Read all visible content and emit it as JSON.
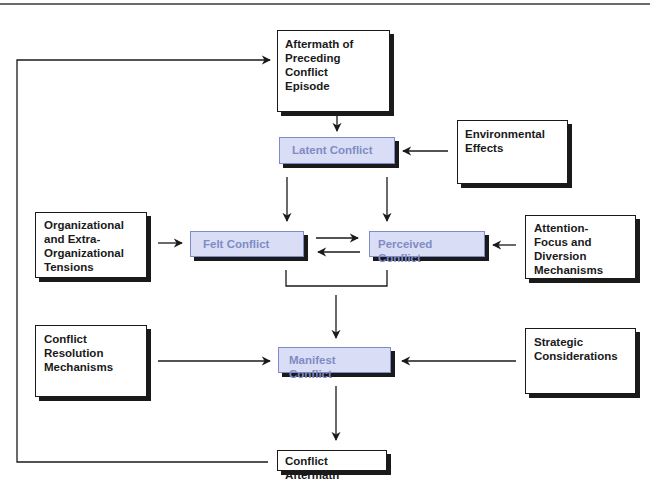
{
  "diagram": {
    "title": "",
    "nodes": {
      "aftermath_preceding": {
        "label": "Aftermath of\nPreceding Conflict\nEpisode",
        "style": "outcome"
      },
      "latent": {
        "label": "Latent Conflict",
        "style": "stage"
      },
      "environmental": {
        "label": "Environmental\nEffects",
        "style": "influence"
      },
      "org_tensions": {
        "label": "Organizational\nand Extra-\nOrganizational\nTensions",
        "style": "influence"
      },
      "felt": {
        "label": "Felt Conflict",
        "style": "stage"
      },
      "perceived": {
        "label": "Perceived Conflict",
        "style": "stage"
      },
      "attention": {
        "label": "Attention-\nFocus and\nDiversion\nMechanisms",
        "style": "influence"
      },
      "resolution": {
        "label": "Conflict\nResolution\nMechanisms",
        "style": "influence"
      },
      "manifest": {
        "label": "Manifest Conflict",
        "style": "stage"
      },
      "strategic": {
        "label": "Strategic\nConsiderations",
        "style": "influence"
      },
      "aftermath": {
        "label": "Conflict Aftermath",
        "style": "outcome"
      }
    },
    "edges": [
      {
        "from": "aftermath_preceding",
        "to": "latent"
      },
      {
        "from": "environmental",
        "to": "latent"
      },
      {
        "from": "latent",
        "to": "felt"
      },
      {
        "from": "latent",
        "to": "perceived"
      },
      {
        "from": "felt",
        "to": "perceived"
      },
      {
        "from": "perceived",
        "to": "felt"
      },
      {
        "from": "org_tensions",
        "to": "felt"
      },
      {
        "from": "attention",
        "to": "perceived"
      },
      {
        "from": "felt+perceived",
        "to": "manifest"
      },
      {
        "from": "resolution",
        "to": "manifest"
      },
      {
        "from": "strategic",
        "to": "manifest"
      },
      {
        "from": "manifest",
        "to": "aftermath"
      },
      {
        "from": "aftermath",
        "to": "aftermath_preceding",
        "type": "feedback-loop"
      }
    ],
    "colors": {
      "stage_fill": "#d9def6",
      "stage_border": "#7d8bc9",
      "stage_text": "#7f8bc4",
      "ink": "#1a1a1a"
    }
  }
}
